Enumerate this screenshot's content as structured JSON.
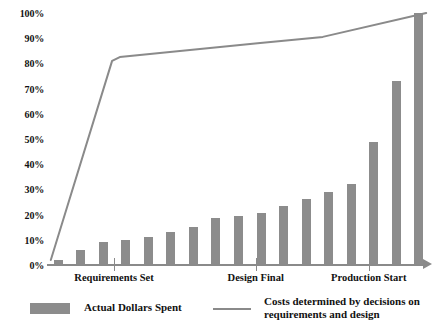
{
  "chart_data": {
    "type": "bar",
    "title": "",
    "subtitle": "",
    "xlabel": "",
    "ylabel": "",
    "ylim": [
      0,
      100
    ],
    "grid": false,
    "legend_position": "bottom",
    "y_ticks": [
      "0%",
      "10%",
      "20%",
      "30%",
      "40%",
      "50%",
      "60%",
      "70%",
      "80%",
      "90%",
      "100%"
    ],
    "y_tick_values": [
      0,
      10,
      20,
      30,
      40,
      50,
      60,
      70,
      80,
      90,
      100
    ],
    "x_milestones": [
      {
        "label": "Requirements Set",
        "position_pct": 17.5
      },
      {
        "label": "Design Final",
        "position_pct": 54.5
      },
      {
        "label": "Production Start",
        "position_pct": 84.0
      }
    ],
    "series": [
      {
        "name": "Actual Dollars Spent",
        "type": "bar",
        "color": "#8c8c8c",
        "values": [
          2,
          6,
          9,
          10,
          11,
          13,
          15,
          18.5,
          19.5,
          20.5,
          23.5,
          26,
          29,
          32,
          49,
          73,
          100
        ]
      },
      {
        "name": "Costs determined by decisions on requirements and design",
        "type": "line",
        "color": "#8a8a8a",
        "points": [
          {
            "x_pct": 1.0,
            "y": 2
          },
          {
            "x_pct": 17.0,
            "y": 81
          },
          {
            "x_pct": 19.0,
            "y": 82.5
          },
          {
            "x_pct": 55.0,
            "y": 88
          },
          {
            "x_pct": 72.0,
            "y": 90.5
          },
          {
            "x_pct": 99.0,
            "y": 100
          }
        ]
      }
    ]
  },
  "legend": {
    "bar_label": "Actual Dollars Spent",
    "line_label_line1": "Costs determined by decisions on",
    "line_label_line2": "requirements and design"
  }
}
